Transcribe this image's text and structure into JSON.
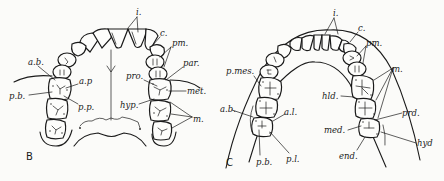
{
  "figure": {
    "panels": [
      {
        "id": "B",
        "label": "B",
        "description": "Upper dental arch (occlusal view)",
        "labels": {
          "incisors": "i.",
          "canine": "c.",
          "premolars": "pm.",
          "paracone": "par.",
          "protocone": "pro.",
          "metacone": "met.",
          "hypocone": "hyp.",
          "molars": "m.",
          "anterior_buccal": "a.b.",
          "anterior_palatal": "a.p",
          "posterior_buccal": "p.b.",
          "posterior_palatal": "p.p."
        }
      },
      {
        "id": "C",
        "label": "C",
        "description": "Lower dental arch (occlusal view)",
        "labels": {
          "incisors": "i.",
          "canine": "c.",
          "premolars": "pm.",
          "molars": "m.",
          "posterior_mesial": "p.mes.",
          "hypoconulid": "hld.",
          "protoconid": "prd.",
          "metaconid": "med.",
          "hypoconid": "hyd",
          "entoconid": "end.",
          "anterior_buccal": "a.b.",
          "anterior_lingual": "a.l.",
          "posterior_buccal": "p.b.",
          "posterior_lingual": "p.l."
        }
      }
    ]
  }
}
